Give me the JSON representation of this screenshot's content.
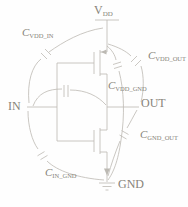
{
  "figure": {
    "type": "cmos-inverter-parasitic-capacitance-schematic",
    "colors": {
      "background": "#fefefe",
      "wire": "#bcb9b3",
      "text": "#878379"
    },
    "power_label": {
      "base": "V",
      "sub": "DD"
    },
    "node_labels": {
      "in": "IN",
      "out": "OUT",
      "gnd": "GND"
    },
    "capacitors": [
      {
        "id": "cap-vdd-in",
        "base": "C",
        "sub": "VDD_IN"
      },
      {
        "id": "cap-vdd-out",
        "base": "C",
        "sub": "VDD_OUT"
      },
      {
        "id": "cap-vdd-gnd",
        "base": "C",
        "sub": "VDD_GND"
      },
      {
        "id": "cap-gnd-out",
        "base": "C",
        "sub": "GND_OUT"
      },
      {
        "id": "cap-in-gnd",
        "base": "C",
        "sub": "IN_GND"
      }
    ]
  }
}
